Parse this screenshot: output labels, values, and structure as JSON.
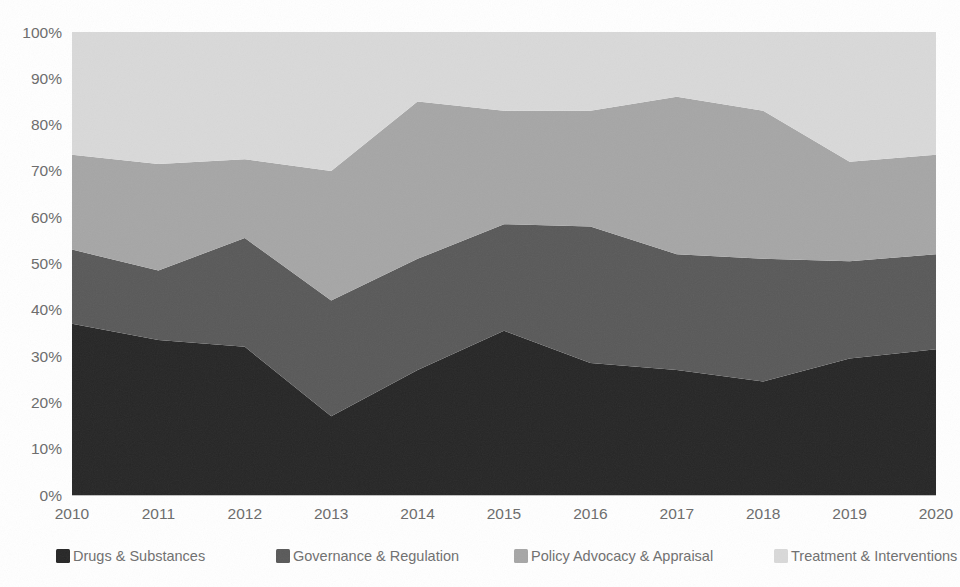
{
  "chart_data": {
    "type": "area",
    "stacked": true,
    "normalized": true,
    "title": "",
    "subtitle": "",
    "xlabel": "",
    "ylabel": "",
    "grid": false,
    "legend_position": "bottom",
    "ylim": [
      0,
      100
    ],
    "y_tick_labels": [
      "0%",
      "10%",
      "20%",
      "30%",
      "40%",
      "50%",
      "60%",
      "70%",
      "80%",
      "90%",
      "100%"
    ],
    "y_tick_values": [
      0,
      10,
      20,
      30,
      40,
      50,
      60,
      70,
      80,
      90,
      100
    ],
    "categories": [
      "2010",
      "2011",
      "2012",
      "2013",
      "2014",
      "2015",
      "2016",
      "2017",
      "2018",
      "2019",
      "2020"
    ],
    "x": [
      2010,
      2011,
      2012,
      2013,
      2014,
      2015,
      2016,
      2017,
      2018,
      2019,
      2020
    ],
    "series": [
      {
        "name": "Drugs & Substances",
        "color": "#262626",
        "values": [
          37.0,
          33.5,
          32.0,
          17.0,
          27.0,
          35.5,
          28.5,
          27.0,
          24.5,
          29.5,
          31.5
        ]
      },
      {
        "name": "Governance & Regulation",
        "color": "#595959",
        "values": [
          16.0,
          15.0,
          23.5,
          25.0,
          24.0,
          23.0,
          29.5,
          25.0,
          26.5,
          21.0,
          20.5
        ]
      },
      {
        "name": "Policy Advocacy & Appraisal",
        "color": "#a6a6a6",
        "values": [
          20.5,
          23.0,
          17.0,
          28.0,
          34.0,
          24.5,
          25.0,
          34.0,
          32.0,
          21.5,
          21.5
        ]
      },
      {
        "name": "Treatment & Interventions",
        "color": "#d9d9d9",
        "values": [
          26.5,
          28.5,
          27.5,
          30.0,
          15.0,
          17.0,
          17.0,
          14.0,
          17.0,
          28.0,
          26.5
        ]
      }
    ],
    "cumulative_tops": {
      "Drugs & Substances": [
        37.0,
        33.5,
        32.0,
        17.0,
        27.0,
        35.5,
        28.5,
        27.0,
        24.5,
        29.5,
        31.5
      ],
      "Governance & Regulation": [
        53.0,
        48.5,
        55.5,
        42.0,
        51.0,
        58.5,
        58.0,
        52.0,
        51.0,
        50.5,
        52.0
      ],
      "Policy Advocacy & Appraisal": [
        73.5,
        71.5,
        72.5,
        70.0,
        85.0,
        83.0,
        83.0,
        86.0,
        83.0,
        72.0,
        73.5
      ],
      "Treatment & Interventions": [
        100,
        100,
        100,
        100,
        100,
        100,
        100,
        100,
        100,
        100,
        100
      ]
    }
  },
  "legend": {
    "items": [
      {
        "label": "Drugs & Substances",
        "color": "#262626"
      },
      {
        "label": "Governance & Regulation",
        "color": "#595959"
      },
      {
        "label": "Policy Advocacy & Appraisal",
        "color": "#a6a6a6"
      },
      {
        "label": "Treatment & Interventions",
        "color": "#d9d9d9"
      }
    ]
  },
  "axes": {
    "y_labels": [
      "100%",
      "90%",
      "80%",
      "70%",
      "60%",
      "50%",
      "40%",
      "30%",
      "20%",
      "10%",
      "0%"
    ],
    "x_labels": [
      "2010",
      "2011",
      "2012",
      "2013",
      "2014",
      "2015",
      "2016",
      "2017",
      "2018",
      "2019",
      "2020"
    ]
  },
  "colors": {
    "axis_text": "#6b6b6b",
    "axis_line": "#bfbfbf",
    "background": "#ffffff"
  }
}
